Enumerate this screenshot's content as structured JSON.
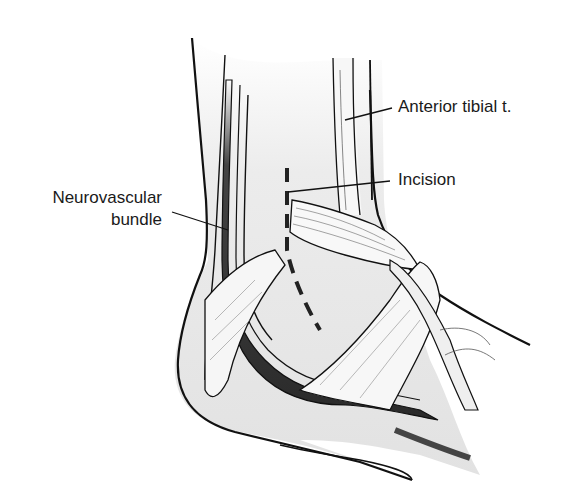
{
  "figure": {
    "colors": {
      "outline": "#111111",
      "skin_fill": "#e6e6e6",
      "tendon_fill": "#f7f7f7",
      "vessel_dark": "#333333",
      "vessel_mid": "#777777",
      "incision": "#222222"
    },
    "labels": [
      {
        "id": "anterior-tibial",
        "text": "Anterior tibial t."
      },
      {
        "id": "incision",
        "text": "Incision"
      },
      {
        "id": "neurovascular-line1",
        "text": "Neurovascular"
      },
      {
        "id": "neurovascular-line2",
        "text": "bundle"
      }
    ]
  }
}
